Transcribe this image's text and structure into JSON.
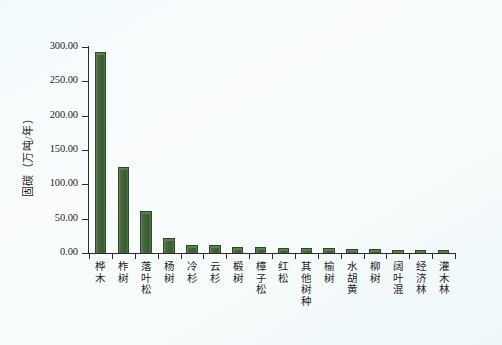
{
  "chart_data": {
    "type": "bar",
    "title": "",
    "subtitle": "",
    "xlabel": "",
    "ylabel": "固碳（万吨/年）",
    "ylim": [
      0,
      300
    ],
    "ytick_values": [
      0,
      50,
      100,
      150,
      200,
      250,
      300
    ],
    "ytick_labels": [
      "0.00",
      "50.00",
      "100.00",
      "150.00",
      "200.00",
      "250.00",
      "300.00"
    ],
    "grid": false,
    "legend": null,
    "legend_position": "none",
    "bar_color": "#3f6237",
    "bar_edge_color": "#2e4b29",
    "categories": [
      "桦木",
      "柞树",
      "落叶松",
      "杨树",
      "冷杉",
      "云杉",
      "椴树",
      "樟子松",
      "红松",
      "其他树种",
      "榆树",
      "水胡黄",
      "柳树",
      "阔叶混",
      "经济林",
      "灌木林"
    ],
    "values": [
      293,
      125,
      61,
      22,
      12,
      11,
      9,
      9,
      8,
      7,
      7,
      6,
      6,
      5,
      5,
      4
    ],
    "series": [
      {
        "name": "固碳量",
        "values": [
          293,
          125,
          61,
          22,
          12,
          11,
          9,
          9,
          8,
          7,
          7,
          6,
          6,
          5,
          5,
          4
        ]
      }
    ]
  },
  "axis": {
    "y_title": "固碳（万吨/年）",
    "y_ticks": [
      "300.00",
      "250.00",
      "200.00",
      "150.00",
      "100.00",
      "50.00",
      "0.00"
    ]
  },
  "categories": [
    {
      "label": "桦木",
      "value": 293
    },
    {
      "label": "柞树",
      "value": 125
    },
    {
      "label": "落叶松",
      "value": 61
    },
    {
      "label": "杨树",
      "value": 22
    },
    {
      "label": "冷杉",
      "value": 12
    },
    {
      "label": "云杉",
      "value": 11
    },
    {
      "label": "椴树",
      "value": 9
    },
    {
      "label": "樟子松",
      "value": 9
    },
    {
      "label": "红松",
      "value": 8
    },
    {
      "label": "其他树种",
      "value": 7
    },
    {
      "label": "榆树",
      "value": 7
    },
    {
      "label": "水胡黄",
      "value": 6
    },
    {
      "label": "柳树",
      "value": 6
    },
    {
      "label": "阔叶混",
      "value": 5
    },
    {
      "label": "经济林",
      "value": 5
    },
    {
      "label": "灌木林",
      "value": 4
    }
  ],
  "footer": {
    "caption": ""
  }
}
